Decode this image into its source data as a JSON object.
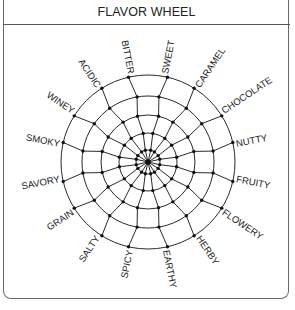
{
  "header": {
    "title": "FLAVOR WHEEL"
  },
  "wheel": {
    "center": [
      148,
      162
    ],
    "rings": [
      12,
      29,
      47,
      66,
      87
    ],
    "line_color": "#2a2a2a",
    "start_angle_deg": -78.75,
    "labels": [
      "SWEET",
      "CARAMEL",
      "CHOCOLATE",
      "NUTTY",
      "FRUITY",
      "FLOWERY",
      "HERBY",
      "EARTHY",
      "SPICY",
      "SALTY",
      "GRAIN",
      "SAVORY",
      "SMOKY",
      "WINEY",
      "ACIDIC",
      "BITTER"
    ]
  }
}
